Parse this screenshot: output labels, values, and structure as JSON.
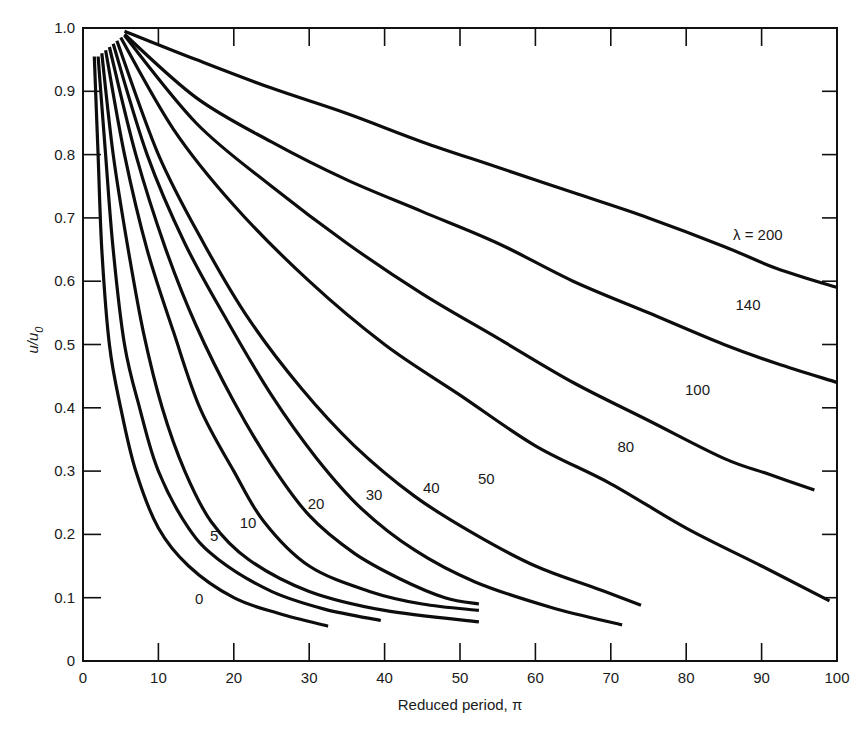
{
  "chart_data": {
    "type": "line",
    "title": "",
    "xlabel": "Reduced period, π",
    "ylabel": "u/u0",
    "xlim": [
      0,
      100
    ],
    "ylim": [
      0,
      1.0
    ],
    "grid": false,
    "legend_position": "inline labels on curves",
    "x_ticks": [
      0,
      10,
      20,
      30,
      40,
      50,
      60,
      70,
      80,
      90,
      100
    ],
    "x_tick_labels": [
      "0",
      "10",
      "20",
      "30",
      "40",
      "50",
      "60",
      "70",
      "80",
      "90",
      "100"
    ],
    "y_ticks": [
      0,
      0.1,
      0.2,
      0.3,
      0.4,
      0.5,
      0.6,
      0.7,
      0.8,
      0.9,
      1.0
    ],
    "y_tick_labels": [
      "0",
      "0.1",
      "0.2",
      "0.3",
      "0.4",
      "0.5",
      "0.6",
      "0.7",
      "0.8",
      "0.9",
      "1.0"
    ],
    "series": [
      {
        "name": "λ = 0",
        "label": "0",
        "label_pos": [
          15.4,
          0.09
        ],
        "points": [
          [
            1.5,
            0.955
          ],
          [
            2,
            0.8
          ],
          [
            2.5,
            0.65
          ],
          [
            3.5,
            0.5
          ],
          [
            5,
            0.4
          ],
          [
            7,
            0.3
          ],
          [
            10,
            0.21
          ],
          [
            14,
            0.15
          ],
          [
            20,
            0.1
          ],
          [
            26,
            0.075
          ],
          [
            32.5,
            0.055
          ]
        ]
      },
      {
        "name": "λ = 5",
        "label": "5",
        "label_pos": [
          17.4,
          0.19
        ],
        "points": [
          [
            2,
            0.955
          ],
          [
            3,
            0.8
          ],
          [
            4,
            0.65
          ],
          [
            5.5,
            0.5
          ],
          [
            7.5,
            0.4
          ],
          [
            10,
            0.3
          ],
          [
            14,
            0.21
          ],
          [
            18,
            0.16
          ],
          [
            25,
            0.11
          ],
          [
            32,
            0.082
          ],
          [
            39.5,
            0.064
          ]
        ]
      },
      {
        "name": "λ = 10",
        "label": "10",
        "label_pos": [
          21.9,
          0.21
        ],
        "points": [
          [
            2.5,
            0.96
          ],
          [
            4,
            0.8
          ],
          [
            6,
            0.65
          ],
          [
            8,
            0.52
          ],
          [
            10.5,
            0.4
          ],
          [
            13.5,
            0.3
          ],
          [
            17,
            0.22
          ],
          [
            22,
            0.16
          ],
          [
            30,
            0.11
          ],
          [
            40,
            0.08
          ],
          [
            52.5,
            0.062
          ]
        ]
      },
      {
        "name": "λ = 20",
        "label": "20",
        "label_pos": [
          30.9,
          0.24
        ],
        "points": [
          [
            3,
            0.965
          ],
          [
            5.5,
            0.8
          ],
          [
            8.5,
            0.65
          ],
          [
            12,
            0.52
          ],
          [
            15.5,
            0.4
          ],
          [
            20,
            0.3
          ],
          [
            24,
            0.22
          ],
          [
            30,
            0.15
          ],
          [
            38,
            0.11
          ],
          [
            45,
            0.09
          ],
          [
            52.5,
            0.08
          ]
        ]
      },
      {
        "name": "λ = 30",
        "label": "30",
        "label_pos": [
          38.6,
          0.255
        ],
        "points": [
          [
            3.5,
            0.97
          ],
          [
            7,
            0.8
          ],
          [
            11,
            0.65
          ],
          [
            15,
            0.53
          ],
          [
            20,
            0.41
          ],
          [
            25,
            0.31
          ],
          [
            30,
            0.23
          ],
          [
            36,
            0.17
          ],
          [
            42,
            0.13
          ],
          [
            48,
            0.1
          ],
          [
            52.5,
            0.09
          ]
        ]
      },
      {
        "name": "λ = 40",
        "label": "40",
        "label_pos": [
          46.2,
          0.265
        ],
        "points": [
          [
            4,
            0.975
          ],
          [
            8.5,
            0.8
          ],
          [
            13.5,
            0.66
          ],
          [
            19,
            0.54
          ],
          [
            25,
            0.42
          ],
          [
            31,
            0.32
          ],
          [
            37,
            0.24
          ],
          [
            44,
            0.175
          ],
          [
            52,
            0.125
          ],
          [
            62,
            0.085
          ],
          [
            71.5,
            0.057
          ]
        ]
      },
      {
        "name": "λ = 50",
        "label": "50",
        "label_pos": [
          53.5,
          0.28
        ],
        "points": [
          [
            4.5,
            0.98
          ],
          [
            10,
            0.8
          ],
          [
            16,
            0.66
          ],
          [
            22,
            0.54
          ],
          [
            29,
            0.43
          ],
          [
            36,
            0.34
          ],
          [
            44,
            0.26
          ],
          [
            52,
            0.2
          ],
          [
            60,
            0.15
          ],
          [
            68,
            0.115
          ],
          [
            74,
            0.088
          ]
        ]
      },
      {
        "name": "λ = 80",
        "label": "80",
        "label_pos": [
          72,
          0.33
        ],
        "points": [
          [
            5,
            0.985
          ],
          [
            12,
            0.84
          ],
          [
            20,
            0.72
          ],
          [
            30,
            0.6
          ],
          [
            40,
            0.5
          ],
          [
            50,
            0.42
          ],
          [
            60,
            0.34
          ],
          [
            70,
            0.28
          ],
          [
            80,
            0.21
          ],
          [
            90,
            0.15
          ],
          [
            99,
            0.095
          ]
        ]
      },
      {
        "name": "λ = 100",
        "label": "100",
        "label_pos": [
          81.5,
          0.42
        ],
        "points": [
          [
            5.5,
            0.988
          ],
          [
            15,
            0.85
          ],
          [
            25,
            0.75
          ],
          [
            35,
            0.66
          ],
          [
            45,
            0.58
          ],
          [
            55,
            0.51
          ],
          [
            65,
            0.44
          ],
          [
            75,
            0.38
          ],
          [
            85,
            0.32
          ],
          [
            91,
            0.295
          ],
          [
            97,
            0.27
          ]
        ]
      },
      {
        "name": "λ = 140",
        "label": "140",
        "label_pos": [
          88.2,
          0.555
        ],
        "points": [
          [
            5.5,
            0.99
          ],
          [
            15,
            0.89
          ],
          [
            25,
            0.82
          ],
          [
            35,
            0.76
          ],
          [
            45,
            0.71
          ],
          [
            55,
            0.66
          ],
          [
            65,
            0.6
          ],
          [
            75,
            0.55
          ],
          [
            85,
            0.5
          ],
          [
            92,
            0.47
          ],
          [
            100,
            0.44
          ]
        ]
      },
      {
        "name": "λ = 200",
        "label": "λ = 200",
        "label_pos": [
          89.5,
          0.665
        ],
        "points": [
          [
            5.5,
            0.995
          ],
          [
            15,
            0.95
          ],
          [
            25,
            0.905
          ],
          [
            35,
            0.865
          ],
          [
            45,
            0.82
          ],
          [
            55,
            0.78
          ],
          [
            65,
            0.74
          ],
          [
            75,
            0.7
          ],
          [
            85,
            0.655
          ],
          [
            92,
            0.62
          ],
          [
            100,
            0.59
          ]
        ]
      }
    ]
  }
}
